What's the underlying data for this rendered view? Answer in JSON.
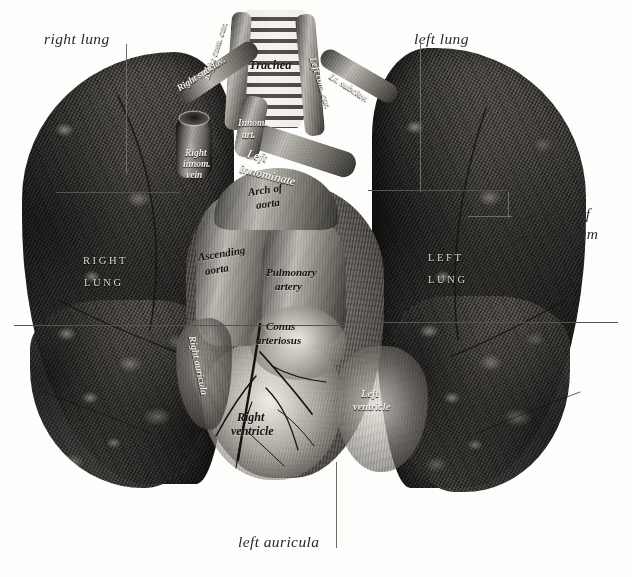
{
  "plate": {
    "background_color": "#fdfdfc",
    "ink_color": "#2b2a28",
    "leader_color": "#6e6c68",
    "width": 632,
    "height": 577
  },
  "margin_labels": {
    "right_lung": "right lung",
    "left_lung": "left lung",
    "cut_edge_line1": "cut edge of",
    "cut_edge_line2": "pericardium",
    "left_auricula": "left auricula"
  },
  "plate_captions": {
    "trachea": "Trachea",
    "right_com_car": "Right com. car.",
    "left_com_car": "Left com. car.",
    "right_subclav": "Right subclav.",
    "left_subclav": "Lt. subclav.",
    "innom_art_line1": "Innom.",
    "innom_art_line2": "art.",
    "right_innom_line1": "Right",
    "right_innom_line2": "innom.",
    "right_innom_line3": "vein",
    "left_innom_line1": "Left",
    "left_innom_line2": "innominate",
    "arch_of_aorta_line1": "Arch of",
    "arch_of_aorta_line2": "aorta",
    "ascending_aorta_line1": "Ascending",
    "ascending_aorta_line2": "aorta",
    "pulmonary_artery_line1": "Pulmonary",
    "pulmonary_artery_line2": "artery",
    "conus_line1": "Conus",
    "conus_line2": "arteriosus",
    "right_auricula": "Right auricula",
    "right_ventricle_line1": "Right",
    "right_ventricle_line2": "ventricle",
    "left_ventricle_line1": "Left",
    "left_ventricle_line2": "ventricle",
    "right_lung_caps_line1": "RIGHT",
    "right_lung_caps_line2": "LUNG",
    "left_lung_caps_line1": "LEFT",
    "left_lung_caps_line2": "LUNG"
  }
}
